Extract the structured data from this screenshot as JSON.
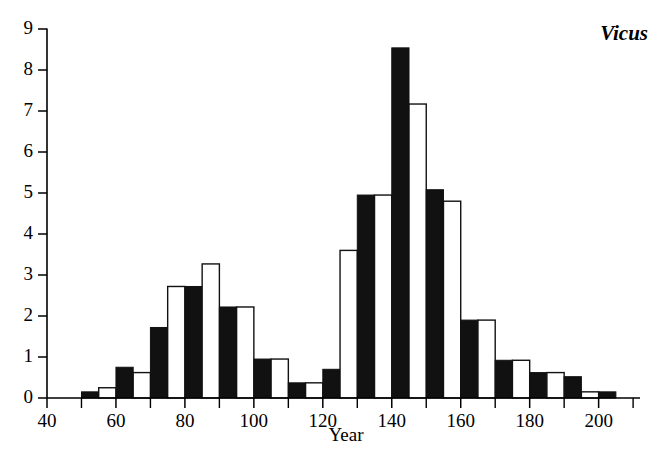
{
  "chart_data": {
    "type": "bar",
    "title": "Vicus",
    "xlabel": "Year",
    "ylabel": "",
    "xlim": [
      40,
      212
    ],
    "ylim": [
      0,
      9
    ],
    "grid": false,
    "legend": false,
    "bin_width": 5,
    "x_tick_major_step": 20,
    "x_tick_minor_step": 10,
    "y_tick_step": 1,
    "x_ticks": [
      40,
      60,
      80,
      100,
      120,
      140,
      160,
      180,
      200
    ],
    "x_ticks_minor": [
      50,
      70,
      90,
      110,
      130,
      150,
      170,
      190,
      210
    ],
    "y_ticks": [
      0,
      1,
      2,
      3,
      4,
      5,
      6,
      7,
      8,
      9
    ],
    "style_note": "alternating filled (black) and open (white) 5-year bins",
    "bars": [
      {
        "x0": 50,
        "x1": 55,
        "value": 0.15,
        "style": "filled"
      },
      {
        "x0": 55,
        "x1": 60,
        "value": 0.25,
        "style": "open"
      },
      {
        "x0": 60,
        "x1": 65,
        "value": 0.75,
        "style": "filled"
      },
      {
        "x0": 65,
        "x1": 70,
        "value": 0.62,
        "style": "open"
      },
      {
        "x0": 70,
        "x1": 75,
        "value": 1.72,
        "style": "filled"
      },
      {
        "x0": 75,
        "x1": 80,
        "value": 2.72,
        "style": "open"
      },
      {
        "x0": 80,
        "x1": 85,
        "value": 2.72,
        "style": "filled"
      },
      {
        "x0": 85,
        "x1": 90,
        "value": 3.27,
        "style": "open"
      },
      {
        "x0": 90,
        "x1": 95,
        "value": 2.22,
        "style": "filled"
      },
      {
        "x0": 95,
        "x1": 100,
        "value": 2.22,
        "style": "open"
      },
      {
        "x0": 100,
        "x1": 105,
        "value": 0.95,
        "style": "filled"
      },
      {
        "x0": 105,
        "x1": 110,
        "value": 0.95,
        "style": "open"
      },
      {
        "x0": 110,
        "x1": 115,
        "value": 0.37,
        "style": "filled"
      },
      {
        "x0": 115,
        "x1": 120,
        "value": 0.37,
        "style": "open"
      },
      {
        "x0": 120,
        "x1": 125,
        "value": 0.7,
        "style": "filled"
      },
      {
        "x0": 125,
        "x1": 130,
        "value": 3.6,
        "style": "open"
      },
      {
        "x0": 130,
        "x1": 135,
        "value": 4.95,
        "style": "filled"
      },
      {
        "x0": 135,
        "x1": 140,
        "value": 4.95,
        "style": "open"
      },
      {
        "x0": 140,
        "x1": 145,
        "value": 8.54,
        "style": "filled"
      },
      {
        "x0": 145,
        "x1": 150,
        "value": 7.17,
        "style": "open"
      },
      {
        "x0": 150,
        "x1": 155,
        "value": 5.08,
        "style": "filled"
      },
      {
        "x0": 155,
        "x1": 160,
        "value": 4.8,
        "style": "open"
      },
      {
        "x0": 160,
        "x1": 165,
        "value": 1.9,
        "style": "filled"
      },
      {
        "x0": 165,
        "x1": 170,
        "value": 1.9,
        "style": "open"
      },
      {
        "x0": 170,
        "x1": 175,
        "value": 0.92,
        "style": "filled"
      },
      {
        "x0": 175,
        "x1": 180,
        "value": 0.92,
        "style": "open"
      },
      {
        "x0": 180,
        "x1": 185,
        "value": 0.62,
        "style": "filled"
      },
      {
        "x0": 185,
        "x1": 190,
        "value": 0.62,
        "style": "open"
      },
      {
        "x0": 190,
        "x1": 195,
        "value": 0.52,
        "style": "filled"
      },
      {
        "x0": 195,
        "x1": 200,
        "value": 0.15,
        "style": "open"
      },
      {
        "x0": 200,
        "x1": 205,
        "value": 0.15,
        "style": "filled"
      }
    ]
  }
}
